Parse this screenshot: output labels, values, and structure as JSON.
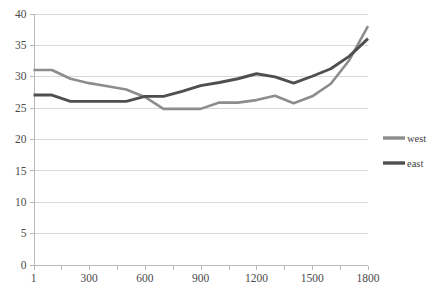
{
  "chart_data": {
    "type": "line",
    "title": "",
    "xlabel": "",
    "ylabel": "",
    "xlim": [
      1,
      1800
    ],
    "ylim": [
      0,
      40
    ],
    "grid": true,
    "legend_position": "right",
    "y_ticks": [
      0,
      5,
      10,
      15,
      20,
      25,
      30,
      35,
      40
    ],
    "y_tick_labels": [
      "0",
      "5",
      "10",
      "15",
      "20",
      "25",
      "30",
      "35",
      "40"
    ],
    "x_ticks": [
      1,
      300,
      600,
      900,
      1200,
      1500,
      1800
    ],
    "x_tick_labels": [
      "1",
      "300",
      "600",
      "900",
      "1200",
      "1500",
      "1800"
    ],
    "x_minor_ticks": [
      150,
      450,
      750,
      1050,
      1350,
      1650
    ],
    "x": [
      1,
      100,
      200,
      300,
      400,
      500,
      600,
      700,
      800,
      900,
      1000,
      1100,
      1200,
      1300,
      1400,
      1500,
      1600,
      1700,
      1800
    ],
    "series": [
      {
        "name": "west",
        "color": "#8d8d8d",
        "width": 2.6,
        "values": [
          31.0,
          31.0,
          29.6,
          28.9,
          28.4,
          27.9,
          26.7,
          24.8,
          24.8,
          24.8,
          25.8,
          25.8,
          26.2,
          26.9,
          25.7,
          26.8,
          28.8,
          32.6,
          38.0
        ]
      },
      {
        "name": "east",
        "color": "#4f4f4f",
        "width": 2.9,
        "values": [
          27.0,
          27.0,
          26.0,
          26.0,
          26.0,
          26.0,
          26.8,
          26.8,
          27.6,
          28.5,
          29.0,
          29.6,
          30.4,
          29.9,
          28.9,
          30.0,
          31.2,
          33.2,
          36.0
        ]
      }
    ]
  },
  "legend": {
    "items": [
      {
        "label": "west",
        "color": "#8d8d8d"
      },
      {
        "label": "east",
        "color": "#4f4f4f"
      }
    ]
  },
  "style": {
    "background": "#ffffff",
    "grid_color": "#d9d9d9",
    "axis_color": "#b8b8b8",
    "tick_text_color": "#4a4a4a"
  }
}
